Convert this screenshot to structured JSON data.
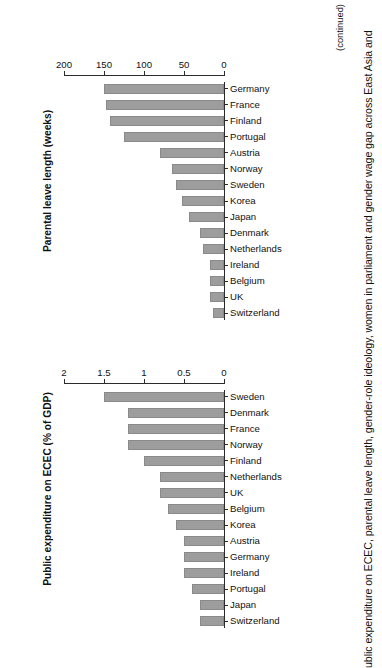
{
  "figure": {
    "caption": "ublic expenditure on ECEC, parental leave length, gender-role ideology, women in parliament and gender wage gap across East Asia and",
    "continued_note": "(continued)"
  },
  "chart_data": [
    {
      "id": "expenditure",
      "type": "bar",
      "title": "Public expenditure on ECEC (% of GDP)",
      "xlabel": "",
      "ylabel": "Public expenditure on ECEC (% of GDP)",
      "ylim": [
        0,
        2
      ],
      "yticks": [
        0,
        0.5,
        1,
        1.5,
        2
      ],
      "ytick_labels": [
        "0",
        "0.5",
        "1",
        "1.5",
        "2"
      ],
      "grid": false,
      "legend": "none",
      "bar_color": "#9d9d9d",
      "categories": [
        "Switzerland",
        "Japan",
        "Portugal",
        "Ireland",
        "Germany",
        "Austria",
        "Korea",
        "Belgium",
        "UK",
        "Netherlands",
        "Finland",
        "Norway",
        "France",
        "Denmark",
        "Sweden"
      ],
      "values": [
        0.3,
        0.3,
        0.4,
        0.5,
        0.5,
        0.5,
        0.6,
        0.7,
        0.8,
        0.8,
        1.0,
        1.2,
        1.2,
        1.2,
        1.5
      ]
    },
    {
      "id": "leave",
      "type": "bar",
      "title": "Parental leave length (weeks)",
      "xlabel": "",
      "ylabel": "Parental leave length (weeks)",
      "ylim": [
        0,
        200
      ],
      "yticks": [
        0,
        50,
        100,
        150,
        200
      ],
      "ytick_labels": [
        "0",
        "50",
        "100",
        "150",
        "200"
      ],
      "grid": false,
      "legend": "none",
      "bar_color": "#9d9d9d",
      "categories": [
        "Switzerland",
        "UK",
        "Belgium",
        "Ireland",
        "Netherlands",
        "Denmark",
        "Japan",
        "Korea",
        "Sweden",
        "Norway",
        "Austria",
        "Portugal",
        "Finland",
        "France",
        "Germany"
      ],
      "values": [
        14,
        18,
        18,
        18,
        26,
        30,
        44,
        53,
        60,
        65,
        80,
        125,
        143,
        148,
        150
      ]
    }
  ]
}
